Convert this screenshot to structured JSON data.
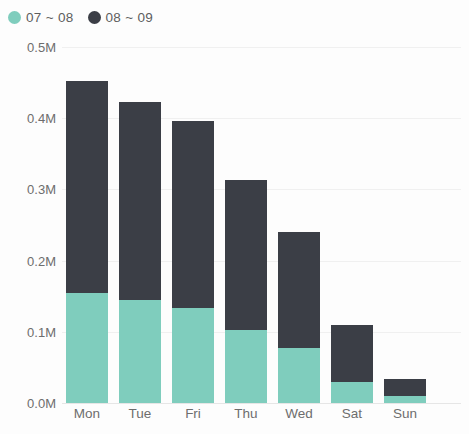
{
  "legend": {
    "position": "top-left",
    "entries": [
      {
        "label": "07 ~ 08",
        "color": "#7fcdbd",
        "marker": "circle"
      },
      {
        "label": "08 ~ 09",
        "color": "#3b3e46",
        "marker": "circle"
      }
    ]
  },
  "axes": {
    "y_ticks": [
      "0.5M",
      "0.4M",
      "0.3M",
      "0.2M",
      "0.1M",
      "0.0M"
    ],
    "x_ticks": [
      "Mon",
      "Tue",
      "Fri",
      "Thu",
      "Wed",
      "Sat",
      "Sun"
    ]
  },
  "colors": {
    "series_07_08": "#7fcdbd",
    "series_08_09": "#3b3e46",
    "gridline": "#f0f0f0",
    "axis_text": "#6d6d6d",
    "background": "#fdfdfd"
  },
  "chart_data": {
    "type": "bar",
    "stacked": true,
    "title": "",
    "subtitle": "",
    "xlabel": "",
    "ylabel": "",
    "ylim": [
      0,
      500000
    ],
    "ytick_values": [
      500000,
      400000,
      300000,
      200000,
      100000,
      0
    ],
    "ytick_labels": [
      "0.5M",
      "0.4M",
      "0.3M",
      "0.2M",
      "0.1M",
      "0.0M"
    ],
    "grid": true,
    "legend_position": "top-left",
    "categories": [
      "Mon",
      "Tue",
      "Fri",
      "Thu",
      "Wed",
      "Sat",
      "Sun"
    ],
    "series": [
      {
        "name": "07 ~ 08",
        "color": "#7fcdbd",
        "values": [
          154000,
          145000,
          133000,
          102000,
          77000,
          30000,
          10000
        ]
      },
      {
        "name": "08 ~ 09",
        "color": "#3b3e46",
        "values": [
          298000,
          278000,
          263000,
          211000,
          163000,
          80000,
          24000
        ]
      }
    ],
    "totals": [
      452000,
      423000,
      396000,
      313000,
      240000,
      110000,
      34000
    ]
  }
}
